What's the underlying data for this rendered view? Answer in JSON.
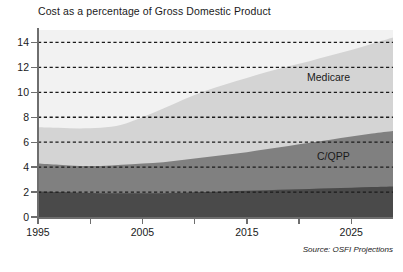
{
  "chart_data": {
    "type": "area",
    "title": "Cost as a percentage of Gross Domestic Product",
    "stacked": true,
    "xlabel": "",
    "ylabel": "",
    "xlim": [
      1995,
      2029
    ],
    "ylim": [
      0,
      15
    ],
    "grid": true,
    "grid_style": "dashed-horizontal",
    "legend_position": "in-plot-labels",
    "source": "Source: OSFI Projections",
    "x_ticks": [
      1995,
      2000,
      2005,
      2010,
      2015,
      2020,
      2025
    ],
    "x_tick_labels": [
      "1995",
      "",
      "2005",
      "",
      "2015",
      "",
      "2025"
    ],
    "y_ticks": [
      0,
      2,
      4,
      6,
      8,
      10,
      12,
      14
    ],
    "y_tick_labels": [
      "0",
      "2",
      "4",
      "6",
      "8",
      "10",
      "12",
      "14"
    ],
    "x": [
      1995,
      1997,
      1999,
      2001,
      2003,
      2005,
      2007,
      2009,
      2011,
      2013,
      2015,
      2017,
      2019,
      2021,
      2023,
      2025,
      2027,
      2029
    ],
    "series": [
      {
        "name": "OAS/GIS",
        "color": "#4a4a4a",
        "values": [
          2.05,
          2.0,
          1.95,
          1.9,
          1.9,
          1.9,
          1.9,
          1.95,
          2.0,
          2.05,
          2.1,
          2.15,
          2.2,
          2.25,
          2.3,
          2.35,
          2.4,
          2.45
        ]
      },
      {
        "name": "C/QPP",
        "color": "#808080",
        "values": [
          2.25,
          2.2,
          2.15,
          2.2,
          2.3,
          2.4,
          2.5,
          2.65,
          2.8,
          2.95,
          3.1,
          3.3,
          3.5,
          3.7,
          3.9,
          4.1,
          4.3,
          4.45
        ]
      },
      {
        "name": "Medicare",
        "color": "#d4d4d4",
        "values": [
          2.9,
          2.95,
          3.0,
          3.05,
          3.2,
          3.7,
          4.3,
          4.85,
          5.3,
          5.65,
          5.95,
          6.2,
          6.4,
          6.55,
          6.75,
          6.95,
          7.2,
          7.5
        ]
      }
    ],
    "cumulative_totals": [
      7.2,
      7.15,
      7.1,
      7.15,
      7.4,
      8.0,
      8.7,
      9.45,
      10.1,
      10.65,
      11.15,
      11.65,
      12.1,
      12.5,
      12.95,
      13.4,
      13.9,
      14.4
    ],
    "annotations": [
      {
        "text": "Medicare",
        "x": 2024,
        "y": 10.6
      },
      {
        "text": "C/QPP",
        "x": 2025,
        "y": 5.0
      }
    ]
  }
}
